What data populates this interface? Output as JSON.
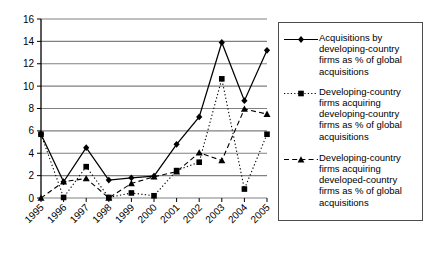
{
  "chart_data": {
    "type": "line",
    "title": "",
    "xlabel": "",
    "ylabel": "",
    "categories": [
      "1995",
      "1996",
      "1997",
      "1998",
      "1999",
      "2000",
      "2001",
      "2002",
      "2003",
      "2004",
      "2005"
    ],
    "ylim": [
      0,
      16
    ],
    "ytick_values": [
      0,
      2,
      4,
      6,
      8,
      10,
      12,
      14,
      16
    ],
    "ytick_labels": [
      "0",
      "2",
      "4",
      "6",
      "8",
      "10",
      "12",
      "14",
      "16"
    ],
    "grid": "horizontal",
    "legend_position": "right",
    "series": [
      {
        "name": "Acquisitions by developing-country firms as % of global acquisitions",
        "marker": "diamond",
        "line_style": "solid",
        "color": "#000000",
        "values": [
          5.7,
          1.45,
          4.5,
          1.6,
          1.8,
          1.95,
          4.8,
          7.25,
          13.9,
          8.7,
          13.2
        ]
      },
      {
        "name": "Developing-country firms acquiring developing-country firms as % of global acquisitions",
        "marker": "square",
        "line_style": "dotted",
        "color": "#000000",
        "values": [
          5.7,
          0.05,
          2.8,
          0.05,
          0.45,
          0.2,
          2.45,
          3.2,
          10.65,
          0.8,
          5.7
        ]
      },
      {
        "name": "Developing-country firms acquiring developed-country firms as % of global acquisitions",
        "marker": "triangle",
        "line_style": "dashed",
        "color": "#000000",
        "values": [
          0.0,
          1.45,
          1.75,
          0.0,
          1.3,
          1.9,
          2.35,
          4.05,
          3.35,
          7.95,
          7.5
        ]
      }
    ]
  },
  "legend": {
    "entries": [
      {
        "label": "Acquisitions by\ndeveloping-country\nfirms as % of global\nacquisitions",
        "marker": "diamond",
        "line_style": "solid"
      },
      {
        "label": "Developing-country\nfirms acquiring\ndeveloping-country\nfirms as % of global\nacquisitions",
        "marker": "square",
        "line_style": "dotted"
      },
      {
        "label": "Developing-country\nfirms acquiring\ndeveloped-country\nfirms as % of global\nacquisitions",
        "marker": "triangle",
        "line_style": "dashed"
      }
    ]
  },
  "colors": {
    "line": "#000000",
    "grid": "#808080",
    "axis": "#000000",
    "legend_border": "#4d4d4d",
    "background": "#ffffff"
  }
}
